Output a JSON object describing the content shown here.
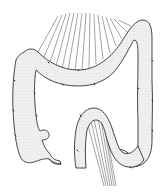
{
  "figure": {
    "parts": [
      "transverse-colon",
      "ascending-colon",
      "cecum",
      "appendix",
      "descending-colon",
      "sigmoid-colon",
      "transverse-mesocolon",
      "sigmoid-mesocolon"
    ],
    "colors": {
      "background": "#ffffff",
      "organ_fill": "#eeeeee",
      "outline": "#333333",
      "mesentery_lines": "#555555"
    }
  }
}
